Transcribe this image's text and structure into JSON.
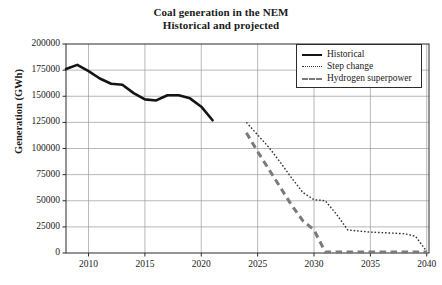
{
  "chart_data": {
    "type": "line",
    "title": "Coal generation in the NEM",
    "subtitle": "Historical and projected",
    "xlabel": "",
    "ylabel": "Generation (GWh)",
    "xlim": [
      2008,
      2040.2
    ],
    "ylim": [
      0,
      200000
    ],
    "grid": true,
    "legend_position": "top-right",
    "xticks": [
      2010,
      2015,
      2020,
      2025,
      2030,
      2035,
      2040
    ],
    "xtick_labels": [
      "2010",
      "2015",
      "2020",
      "2025",
      "2030",
      "2035",
      "2040"
    ],
    "yticks": [
      0,
      25000,
      50000,
      75000,
      100000,
      125000,
      150000,
      175000,
      200000
    ],
    "ytick_labels": [
      "0",
      "25000",
      "50000",
      "75000",
      "100000",
      "125000",
      "150000",
      "175000",
      "200000"
    ],
    "series": [
      {
        "name": "Historical",
        "style": "solid",
        "color": "#141414",
        "width": 2.6,
        "x": [
          2008,
          2009,
          2010,
          2011,
          2012,
          2013,
          2014,
          2015,
          2016,
          2017,
          2018,
          2019,
          2020,
          2021
        ],
        "values": [
          176000,
          180000,
          174000,
          167000,
          162000,
          161000,
          153000,
          147000,
          146000,
          151000,
          151000,
          148000,
          140000,
          127000
        ]
      },
      {
        "name": "Step change",
        "style": "dotted",
        "color": "#333333",
        "width": 1.4,
        "x": [
          2024,
          2025,
          2026,
          2027,
          2028,
          2029,
          2030,
          2031,
          2032,
          2033,
          2034,
          2035,
          2036,
          2037,
          2038,
          2039,
          2040
        ],
        "values": [
          125000,
          113000,
          101000,
          87000,
          72000,
          58000,
          51000,
          50000,
          37000,
          22000,
          21000,
          20000,
          19500,
          19000,
          18500,
          16000,
          1500
        ]
      },
      {
        "name": "Hydrogen superpower",
        "style": "dashed",
        "color": "#7a7a7a",
        "width": 3.0,
        "x": [
          2024,
          2025,
          2026,
          2027,
          2028,
          2029,
          2030,
          2031,
          2032,
          2034,
          2036,
          2038,
          2040
        ],
        "values": [
          115000,
          97000,
          80000,
          63000,
          46000,
          31000,
          22000,
          1000,
          1000,
          1000,
          1000,
          1000,
          1000
        ]
      }
    ]
  },
  "legend": {
    "items": [
      {
        "label": "Historical"
      },
      {
        "label": "Step change"
      },
      {
        "label": "Hydrogen superpower"
      }
    ]
  }
}
